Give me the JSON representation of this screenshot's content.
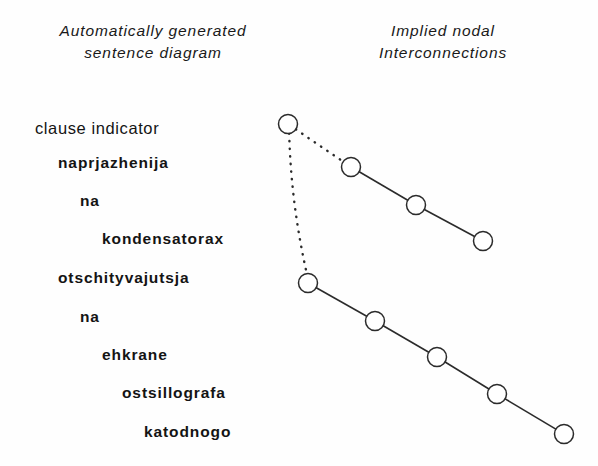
{
  "figure": {
    "background_color": "#fefefe",
    "ink_color": "#1a1a1a"
  },
  "headers": {
    "left": {
      "line1": "Automatically generated",
      "line2": "sentence diagram"
    },
    "right": {
      "line1": "Implied nodal",
      "line2": "Interconnections"
    }
  },
  "sentence": {
    "lines": [
      {
        "text": "clause indicator",
        "x": 35,
        "y": 132,
        "bold": false
      },
      {
        "text": "naprjazhenija",
        "x": 58,
        "y": 167,
        "bold": true
      },
      {
        "text": "na",
        "x": 80,
        "y": 205,
        "bold": true
      },
      {
        "text": "kondensatorax",
        "x": 102,
        "y": 243,
        "bold": true
      },
      {
        "text": "otschityvajutsja",
        "x": 58,
        "y": 282,
        "bold": true
      },
      {
        "text": "na",
        "x": 80,
        "y": 321,
        "bold": true
      },
      {
        "text": "ehkrane",
        "x": 102,
        "y": 359,
        "bold": true
      },
      {
        "text": "ostsillografa",
        "x": 122,
        "y": 397,
        "bold": true
      },
      {
        "text": "katodnogo",
        "x": 144,
        "y": 436,
        "bold": true
      }
    ]
  },
  "chart_data": {
    "type": "diagram",
    "title": "Implied nodal Interconnections",
    "node_radius": 9.5,
    "node_stroke": "#2b2b2b",
    "node_fill": "#ffffff",
    "nodes": [
      {
        "id": "n1",
        "label": "clause indicator",
        "x": 288,
        "y": 124
      },
      {
        "id": "n2",
        "label": "naprjazhenija",
        "x": 351,
        "y": 167
      },
      {
        "id": "n3",
        "label": "na",
        "x": 416,
        "y": 205
      },
      {
        "id": "n4",
        "label": "kondensatorax",
        "x": 483,
        "y": 241
      },
      {
        "id": "n5",
        "label": "otschityvajutsja",
        "x": 308,
        "y": 283
      },
      {
        "id": "n6",
        "label": "na",
        "x": 375,
        "y": 321
      },
      {
        "id": "n7",
        "label": "ehkrane",
        "x": 437,
        "y": 357
      },
      {
        "id": "n8",
        "label": "ostsillografa",
        "x": 497,
        "y": 394
      },
      {
        "id": "n9",
        "label": "katodnogo",
        "x": 564,
        "y": 434
      }
    ],
    "edges": [
      {
        "from": "n1",
        "to": "n2",
        "style": "dotted"
      },
      {
        "from": "n1",
        "to": "n5",
        "style": "dotted"
      },
      {
        "from": "n2",
        "to": "n3",
        "style": "solid"
      },
      {
        "from": "n3",
        "to": "n4",
        "style": "solid"
      },
      {
        "from": "n5",
        "to": "n6",
        "style": "solid"
      },
      {
        "from": "n6",
        "to": "n7",
        "style": "solid"
      },
      {
        "from": "n7",
        "to": "n8",
        "style": "solid"
      },
      {
        "from": "n8",
        "to": "n9",
        "style": "solid"
      }
    ]
  }
}
